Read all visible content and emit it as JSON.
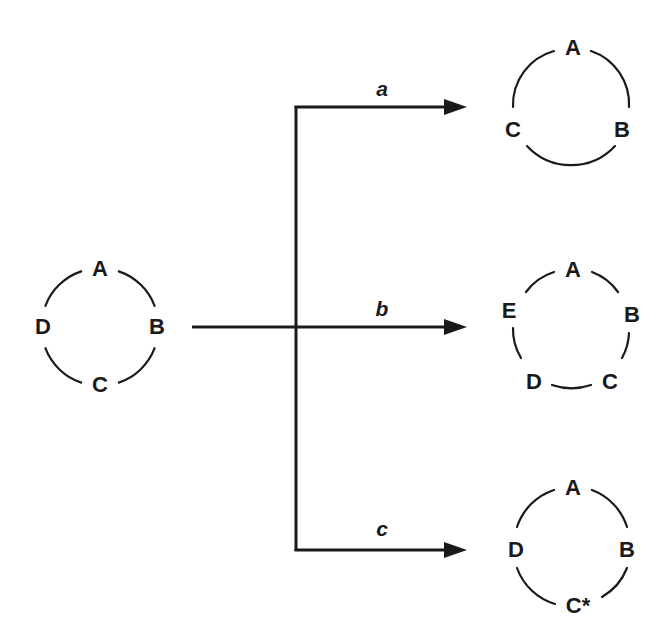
{
  "diagram": {
    "type": "ring-transformation",
    "source_ring": {
      "nodes": [
        "A",
        "B",
        "C",
        "D"
      ]
    },
    "branches": [
      {
        "label": "a",
        "result_ring": {
          "nodes": [
            "A",
            "B",
            "C"
          ]
        }
      },
      {
        "label": "b",
        "result_ring": {
          "nodes": [
            "A",
            "B",
            "C",
            "D",
            "E"
          ]
        }
      },
      {
        "label": "c",
        "result_ring": {
          "nodes": [
            "A",
            "B",
            "C*",
            "D"
          ]
        }
      }
    ],
    "colors": {
      "ink": "#1a1a1a",
      "background": "#ffffff"
    }
  }
}
